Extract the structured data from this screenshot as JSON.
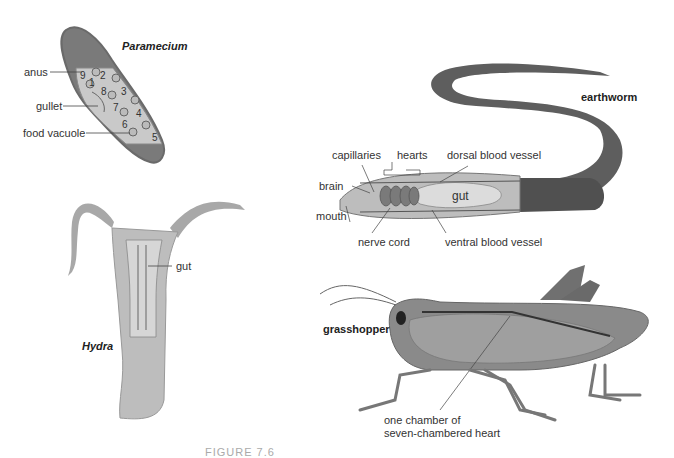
{
  "figure": {
    "caption": "FIGURE 7.6"
  },
  "organisms": {
    "paramecium": {
      "title": "Paramecium",
      "labels": {
        "anus": "anus",
        "gullet": "gullet",
        "food_vacuole": "food vacuole"
      },
      "vacuole_numbers": [
        "1",
        "2",
        "3",
        "4",
        "5",
        "6",
        "7",
        "8",
        "9"
      ]
    },
    "hydra": {
      "title": "Hydra",
      "labels": {
        "gut": "gut"
      }
    },
    "earthworm": {
      "title": "earthworm",
      "labels": {
        "capillaries": "capillaries",
        "hearts": "hearts",
        "dorsal_blood_vessel": "dorsal blood vessel",
        "brain": "brain",
        "mouth": "mouth",
        "gut": "gut",
        "nerve_cord": "nerve cord",
        "ventral_blood_vessel": "ventral blood vessel"
      }
    },
    "grasshopper": {
      "title": "grasshopper",
      "labels": {
        "heart_line1": "one chamber of",
        "heart_line2": "seven-chambered heart"
      }
    }
  },
  "colors": {
    "body_dark": "#6e6e6e",
    "body_mid": "#9a9a9a",
    "body_light": "#c4c4c4",
    "cavity": "#d8d8d8",
    "line": "#555555",
    "text": "#333333"
  }
}
